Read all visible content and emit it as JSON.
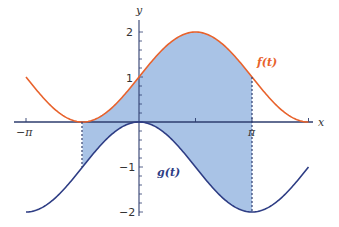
{
  "chart_data": {
    "type": "line",
    "title": "",
    "xlabel": "x",
    "ylabel": "y",
    "xlim": [
      -3.14159,
      4.71239
    ],
    "ylim": [
      -2,
      2
    ],
    "x_ticks": [
      {
        "value": -3.14159,
        "label": "−π"
      },
      {
        "value": 1.5708,
        "label": ""
      },
      {
        "value": 3.14159,
        "label": "π"
      },
      {
        "value": 4.71239,
        "label": ""
      }
    ],
    "y_ticks": [
      {
        "value": 2,
        "label": "2"
      },
      {
        "value": 1,
        "label": "1"
      },
      {
        "value": -1,
        "label": "−1"
      },
      {
        "value": -2,
        "label": "−2"
      }
    ],
    "grid": false,
    "series": [
      {
        "name": "f(t)",
        "formula": "1 + sin(t)",
        "color": "#e8622c",
        "x": [
          -3.14159,
          -1.5708,
          0,
          1.5708,
          3.14159,
          4.71239
        ],
        "values": [
          1,
          0,
          1,
          2,
          1,
          0
        ]
      },
      {
        "name": "g(t)",
        "formula": "cos(t) - 1",
        "color": "#2e3d84",
        "x": [
          -3.14159,
          -1.5708,
          0,
          1.5708,
          3.14159,
          4.71239
        ],
        "values": [
          -2,
          -1,
          0,
          -1,
          -2,
          -1
        ]
      }
    ],
    "shaded_region": {
      "between": [
        "f(t)",
        "g(t)"
      ],
      "x_from": -1.5708,
      "x_to": 3.14159,
      "color": "#a9c3e6"
    },
    "annotations": [
      {
        "text": "f(t)",
        "near_x": 3.6,
        "near_y": 1.35
      },
      {
        "text": "g(t)",
        "near_x": 0.9,
        "near_y": -1.1
      }
    ]
  },
  "labels": {
    "x_axis": "x",
    "y_axis": "y",
    "f_label": "f(t)",
    "g_label": "g(t)",
    "neg_pi": "−π",
    "pi": "π",
    "y2": "2",
    "y1": "1",
    "yn1": "−1",
    "yn2": "−2"
  }
}
